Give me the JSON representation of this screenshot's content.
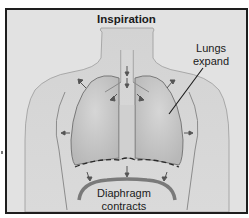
{
  "diagram": {
    "title": "Inspiration",
    "labels": {
      "lungs": {
        "line1": "Lungs",
        "line2": "expand"
      },
      "diaphragm": {
        "line1": "Diaphragm",
        "line2": "contracts"
      }
    },
    "elements": [
      "torso",
      "neck",
      "trachea",
      "left-lung",
      "right-lung",
      "rib-cage",
      "diaphragm-relaxed-dashed",
      "diaphragm-contracted",
      "expansion-arrows"
    ],
    "colors": {
      "background": "#e2e2e2",
      "skin": "#cfcfcf",
      "lung": "#c4c4c4",
      "outline": "#1e1e1e",
      "diaphragm": "#7a7a7a"
    }
  }
}
